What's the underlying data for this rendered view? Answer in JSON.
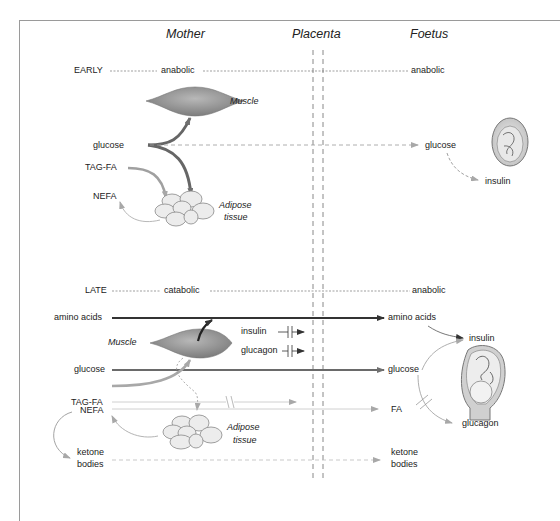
{
  "headers": {
    "mother": "Mother",
    "placenta": "Placenta",
    "foetus": "Foetus"
  },
  "early": {
    "stage": "EARLY",
    "mother_state": "anabolic",
    "foetus_state": "anabolic",
    "muscle_label": "Muscle",
    "adipose_label_1": "Adipose",
    "adipose_label_2": "tissue",
    "mother_items": [
      "glucose",
      "TAG-FA",
      "NEFA"
    ],
    "foetus_items": [
      "glucose",
      "insulin"
    ]
  },
  "late": {
    "stage": "LATE",
    "mother_state": "catabolic",
    "foetus_state": "anabolic",
    "muscle_label": "Muscle",
    "adipose_label_1": "Adipose",
    "adipose_label_2": "tissue",
    "mother_items": [
      "amino acids",
      "glucose",
      "TAG-FA",
      "NEFA",
      "ketone",
      "bodies"
    ],
    "placenta_blocked": [
      "insulin",
      "glucagon"
    ],
    "foetus_items": [
      "amino acids",
      "insulin",
      "glucose",
      "FA",
      "glucagon",
      "ketone",
      "bodies"
    ]
  },
  "colors": {
    "frame": "#9a9a9a",
    "dark_arrow": "#333333",
    "mid_arrow": "#6e6e6e",
    "light_arrow": "#b8b8b8",
    "muscle_fill": "#8f8f8f",
    "adipose_fill": "#ececec"
  }
}
